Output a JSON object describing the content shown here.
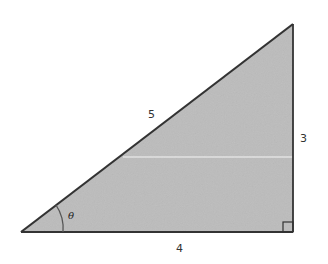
{
  "diagram": {
    "type": "right-triangle",
    "fill_color": "#b9b9b9",
    "stroke_color": "#333333",
    "sides": {
      "hypotenuse": "5",
      "opposite": "3",
      "adjacent": "4"
    },
    "angle_label": "θ",
    "right_angle_marker": true
  }
}
